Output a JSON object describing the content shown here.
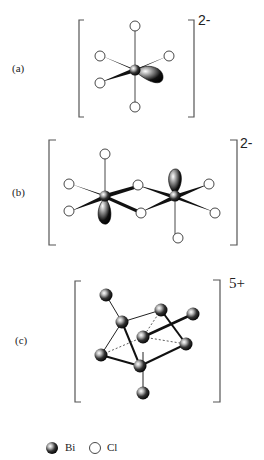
{
  "figure": {
    "panels": [
      {
        "id": "a",
        "label": "(a)",
        "charge": "2-",
        "description": "BiCl5 square pyramid with stereochemically active lone pair"
      },
      {
        "id": "b",
        "label": "(b)",
        "charge": "2-",
        "description": "Bi2Cl8 edge-sharing dimer with lone pairs"
      },
      {
        "id": "c",
        "label": "(c)",
        "charge": "5+",
        "description": "Bi9 tricapped trigonal prism cluster"
      }
    ],
    "legend": {
      "items": [
        {
          "symbol": "filled-sphere",
          "label": "Bi"
        },
        {
          "symbol": "open-circle",
          "label": "Cl"
        }
      ]
    }
  },
  "colors": {
    "bond": "#111111",
    "line": "#444444",
    "bracket": "#555555",
    "cl_fill": "#ffffff",
    "bi_fill": "#222222"
  }
}
